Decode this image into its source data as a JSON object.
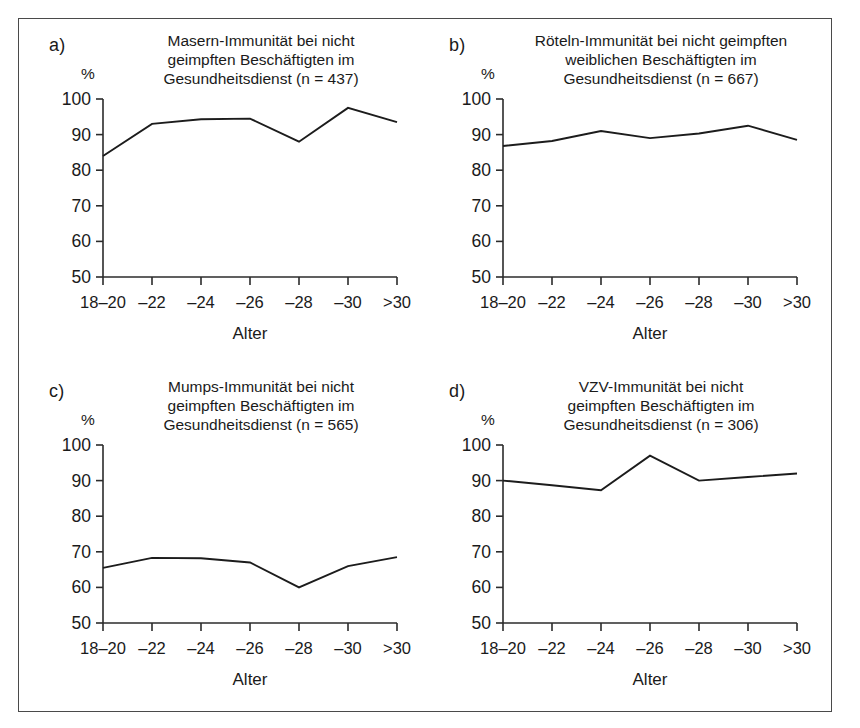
{
  "figure": {
    "x_axis_title": "Alter",
    "y_axis_unit": "%",
    "x_tick_labels": [
      "18–20",
      "–22",
      "–24",
      "–26",
      "–28",
      "–30",
      ">30"
    ],
    "y_tick_labels": [
      "100",
      "90",
      "80",
      "70",
      "60",
      "50"
    ],
    "line_color": "#1c1c1c",
    "frame_color": "#4a4a4a"
  },
  "panels": {
    "a": {
      "letter": "a)",
      "title_line1": "Masern-Immunität bei nicht",
      "title_line2": "geimpften Beschäftigten im",
      "title_line3": "Gesundheitsdienst (n = 437)"
    },
    "b": {
      "letter": "b)",
      "title_line1": "Röteln-Immunität bei nicht geimpften",
      "title_line2": "weiblichen Beschäftigten im",
      "title_line3": "Gesundheitsdienst (n = 667)"
    },
    "c": {
      "letter": "c)",
      "title_line1": "Mumps-Immunität bei nicht",
      "title_line2": "geimpften Beschäftigten im",
      "title_line3": "Gesundheitsdienst (n = 565)"
    },
    "d": {
      "letter": "d)",
      "title_line1": "VZV-Immunität bei nicht",
      "title_line2": "geimpften Beschäftigten im",
      "title_line3": "Gesundheitsdienst (n = 306)"
    }
  },
  "chart_data": [
    {
      "type": "line",
      "panel": "a",
      "title": "Masern-Immunität bei nicht geimpften Beschäftigten im Gesundheitsdienst (n = 437)",
      "xlabel": "Alter",
      "ylabel": "%",
      "categories": [
        "18–20",
        "–22",
        "–24",
        "–26",
        "–28",
        "–30",
        ">30"
      ],
      "values": [
        84.0,
        93.0,
        94.3,
        94.5,
        88.0,
        97.5,
        93.5
      ],
      "ylim": [
        50,
        100
      ],
      "yticks": [
        50,
        60,
        70,
        80,
        90,
        100
      ],
      "grid": false,
      "legend": "none"
    },
    {
      "type": "line",
      "panel": "b",
      "title": "Röteln-Immunität bei nicht geimpften weiblichen Beschäftigten im Gesundheitsdienst (n = 667)",
      "xlabel": "Alter",
      "ylabel": "%",
      "categories": [
        "18–20",
        "–22",
        "–24",
        "–26",
        "–28",
        "–30",
        ">30"
      ],
      "values": [
        86.8,
        88.2,
        91.0,
        89.0,
        90.3,
        92.5,
        88.5
      ],
      "ylim": [
        50,
        100
      ],
      "yticks": [
        50,
        60,
        70,
        80,
        90,
        100
      ],
      "grid": false,
      "legend": "none"
    },
    {
      "type": "line",
      "panel": "c",
      "title": "Mumps-Immunität bei nicht geimpften Beschäftigten im Gesundheitsdienst (n = 565)",
      "xlabel": "Alter",
      "ylabel": "%",
      "categories": [
        "18–20",
        "–22",
        "–24",
        "–26",
        "–28",
        "–30",
        ">30"
      ],
      "values": [
        65.5,
        68.3,
        68.2,
        67.0,
        60.0,
        66.0,
        68.5
      ],
      "ylim": [
        50,
        100
      ],
      "yticks": [
        50,
        60,
        70,
        80,
        90,
        100
      ],
      "grid": false,
      "legend": "none"
    },
    {
      "type": "line",
      "panel": "d",
      "title": "VZV-Immunität bei nicht geimpften Beschäftigten im Gesundheitsdienst (n = 306)",
      "xlabel": "Alter",
      "ylabel": "%",
      "categories": [
        "18–20",
        "–22",
        "–24",
        "–26",
        "–28",
        "–30",
        ">30"
      ],
      "values": [
        90.0,
        88.7,
        87.3,
        97.0,
        90.0,
        91.0,
        92.0
      ],
      "ylim": [
        50,
        100
      ],
      "yticks": [
        50,
        60,
        70,
        80,
        90,
        100
      ],
      "grid": false,
      "legend": "none"
    }
  ]
}
